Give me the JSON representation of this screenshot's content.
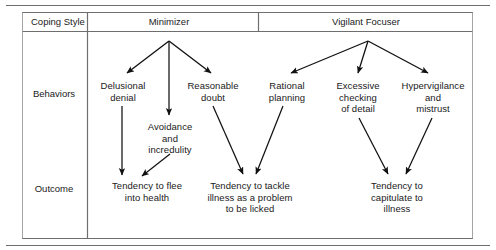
{
  "figure": {
    "type": "flow-diagram",
    "title_present": false,
    "colors": {
      "line": "#5c5c5c",
      "arrow": "#111111",
      "text": "#1a1a1a",
      "background": "#ffffff"
    },
    "table": {
      "corner_header": "Coping Style",
      "column_headers": [
        "Minimizer",
        "Vigilant Focuser"
      ],
      "row_labels": [
        "Behaviors",
        "Outcome"
      ]
    },
    "nodes": [
      {
        "id": "minimizer",
        "label": "Minimizer",
        "x": 169,
        "y": 21,
        "column": "Minimizer",
        "row": "header"
      },
      {
        "id": "vigilant",
        "label": "Vigilant Focuser",
        "x": 366,
        "y": 21,
        "column": "Vigilant Focuser",
        "row": "header"
      },
      {
        "id": "delusional",
        "label": "Delusional\ndenial",
        "x": 123,
        "y": 87,
        "column": "Minimizer",
        "row": "Behaviors"
      },
      {
        "id": "avoidance",
        "label": "Avoidance\nand\nincredulity",
        "x": 170,
        "y": 128,
        "column": "Minimizer",
        "row": "Behaviors"
      },
      {
        "id": "reasonable",
        "label": "Reasonable\ndoubt",
        "x": 213,
        "y": 87,
        "column": "Minimizer",
        "row": "Behaviors"
      },
      {
        "id": "rational",
        "label": "Rational\nplanning",
        "x": 287,
        "y": 87,
        "column": "Vigilant Focuser",
        "row": "Behaviors"
      },
      {
        "id": "excessive",
        "label": "Excessive\nchecking\nof detail",
        "x": 358,
        "y": 87,
        "column": "Vigilant Focuser",
        "row": "Behaviors"
      },
      {
        "id": "hypervigilance",
        "label": "Hypervigilance\nand\nmistrust",
        "x": 433,
        "y": 87,
        "column": "Vigilant Focuser",
        "row": "Behaviors"
      },
      {
        "id": "flee",
        "label": "Tendency to flee\ninto health",
        "x": 147,
        "y": 186,
        "column": "Minimizer",
        "row": "Outcome"
      },
      {
        "id": "tackle",
        "label": "Tendency to tackle\nillness as a problem\nto be licked",
        "x": 250,
        "y": 186,
        "column": "Minimizer/Vigilant Focuser",
        "row": "Outcome"
      },
      {
        "id": "capitulate",
        "label": "Tendency to\ncapitulate to\nillness",
        "x": 397,
        "y": 186,
        "column": "Vigilant Focuser",
        "row": "Outcome"
      }
    ],
    "edges": [
      {
        "from": "minimizer",
        "to": "delusional"
      },
      {
        "from": "minimizer",
        "to": "avoidance"
      },
      {
        "from": "minimizer",
        "to": "reasonable"
      },
      {
        "from": "vigilant",
        "to": "rational"
      },
      {
        "from": "vigilant",
        "to": "excessive"
      },
      {
        "from": "vigilant",
        "to": "hypervigilance"
      },
      {
        "from": "delusional",
        "to": "flee"
      },
      {
        "from": "avoidance",
        "to": "flee"
      },
      {
        "from": "reasonable",
        "to": "tackle"
      },
      {
        "from": "rational",
        "to": "tackle"
      },
      {
        "from": "excessive",
        "to": "capitulate"
      },
      {
        "from": "hypervigilance",
        "to": "capitulate"
      }
    ]
  }
}
